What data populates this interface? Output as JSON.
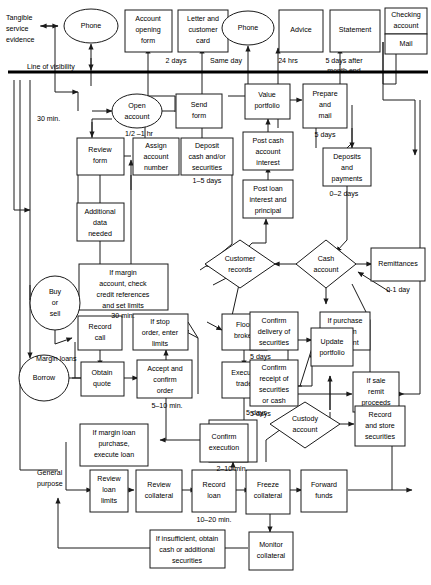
{
  "diagram": {
    "type": "service-blueprint-flowchart",
    "visibility_line_label": "Line of visibility",
    "evidence_label": "Tangible\nservice\nevidence",
    "evidence_lines": [
      "Tangible",
      "service",
      "evidence"
    ],
    "colors": {
      "stroke": "#1a1a1a",
      "fill": "#ffffff",
      "visibility_line": "#000000"
    }
  },
  "nodes": {
    "phone1": {
      "label": "Phone",
      "shape": "ellipse"
    },
    "account_opening_form": {
      "label": "Account\nopening\nform",
      "lines": [
        "Account",
        "opening",
        "form"
      ],
      "shape": "rect"
    },
    "letter_customer_card": {
      "label": "Letter and\ncustomer\ncard",
      "lines": [
        "Letter and",
        "customer",
        "card"
      ],
      "shape": "rect"
    },
    "phone2": {
      "label": "Phone",
      "shape": "ellipse"
    },
    "advice": {
      "label": "Advice",
      "shape": "rect"
    },
    "statement": {
      "label": "Statement",
      "shape": "rect"
    },
    "checking_account": {
      "label": "Checking\naccount",
      "lines": [
        "Checking",
        "account"
      ],
      "shape": "rect"
    },
    "mail": {
      "label": "Mail",
      "shape": "rect"
    },
    "open_account": {
      "label": "Open\naccount",
      "lines": [
        "Open",
        "account"
      ],
      "shape": "ellipse"
    },
    "send_form": {
      "label": "Send\nform",
      "lines": [
        "Send",
        "form"
      ],
      "shape": "rect"
    },
    "review_form": {
      "label": "Review\nform",
      "lines": [
        "Review",
        "form"
      ],
      "shape": "rect"
    },
    "assign_account_number": {
      "label": "Assign\naccount\nnumber",
      "lines": [
        "Assign",
        "account",
        "number"
      ],
      "shape": "rect"
    },
    "deposit_cash": {
      "label": "Deposit\ncash and/or\nsecurities",
      "lines": [
        "Deposit",
        "cash and/or",
        "securities"
      ],
      "shape": "rect"
    },
    "additional_data": {
      "label": "Additional\ndata\nneeded",
      "lines": [
        "Additional",
        "data",
        "needed"
      ],
      "shape": "rect"
    },
    "if_margin_check": {
      "label": "If margin\naccount, check\ncredit references\nand set limits",
      "lines": [
        "If margin",
        "account, check",
        "credit references",
        "and set limits"
      ],
      "shape": "rect"
    },
    "value_portfolio": {
      "label": "Value\nportfolio",
      "lines": [
        "Value",
        "portfolio"
      ],
      "shape": "rect"
    },
    "prepare_mail": {
      "label": "Prepare\nand\nmail",
      "lines": [
        "Prepare",
        "and",
        "mail"
      ],
      "shape": "rect"
    },
    "post_cash_interest": {
      "label": "Post cash\naccount\ninterest",
      "lines": [
        "Post cash",
        "account",
        "interest"
      ],
      "shape": "rect"
    },
    "deposits_payments": {
      "label": "Deposits\nand\npayments",
      "lines": [
        "Deposits",
        "and",
        "payments"
      ],
      "shape": "rect"
    },
    "post_loan_interest": {
      "label": "Post loan\ninterest and\nprincipal",
      "lines": [
        "Post loan",
        "interest and",
        "principal"
      ],
      "shape": "rect"
    },
    "customer_records": {
      "label": "Customer\nrecords",
      "lines": [
        "Customer",
        "records"
      ],
      "shape": "diamond"
    },
    "cash_account": {
      "label": "Cash\naccount",
      "lines": [
        "Cash",
        "account"
      ],
      "shape": "diamond"
    },
    "remittances": {
      "label": "Remittances",
      "shape": "rect"
    },
    "buy_or_sell": {
      "label": "Buy\nor\nsell",
      "lines": [
        "Buy",
        "or",
        "sell"
      ],
      "shape": "ellipse"
    },
    "borrow": {
      "label": "Borrow",
      "shape": "ellipse"
    },
    "record_call": {
      "label": "Record\ncall",
      "lines": [
        "Record",
        "call"
      ],
      "shape": "rect"
    },
    "if_stop_order": {
      "label": "If stop\norder, enter\nlimits",
      "lines": [
        "If stop",
        "order, enter",
        "limits"
      ],
      "shape": "rect"
    },
    "floor_broker": {
      "label": "Floor\nbroker",
      "lines": [
        "Floor",
        "broker"
      ],
      "shape": "rect"
    },
    "obtain_quote": {
      "label": "Obtain\nquote",
      "lines": [
        "Obtain",
        "quote"
      ],
      "shape": "rect"
    },
    "accept_confirm_order": {
      "label": "Accept and\nconfirm\norder",
      "lines": [
        "Accept and",
        "confirm",
        "order"
      ],
      "shape": "rect"
    },
    "execute_trade": {
      "label": "Execute\ntrade",
      "lines": [
        "Execute",
        "trade"
      ],
      "shape": "rect"
    },
    "confirm_delivery": {
      "label": "Confirm\ndelivery of\nsecurities",
      "lines": [
        "Confirm",
        "delivery of",
        "securities"
      ],
      "shape": "rect"
    },
    "confirm_receipt": {
      "label": "Confirm\nreceipt of\nsecurities\nor cash",
      "lines": [
        "Confirm",
        "receipt of",
        "securities",
        "or cash"
      ],
      "shape": "rect"
    },
    "update_portfolio": {
      "label": "Update\nportfolio",
      "lines": [
        "Update",
        "portfolio"
      ],
      "shape": "rect"
    },
    "if_purchase_confirm": {
      "label": "If purchase\nconfirm\npayment",
      "lines": [
        "If purchase",
        "confirm",
        "payment"
      ],
      "shape": "rect"
    },
    "if_sale_remit": {
      "label": "If sale\nremit\nproceeds",
      "lines": [
        "If sale",
        "remit",
        "proceeds"
      ],
      "shape": "rect"
    },
    "if_margin_loan": {
      "label": "If margin loan\npurchase,\nexecute loan",
      "lines": [
        "If margin loan",
        "purchase,",
        "execute loan"
      ],
      "shape": "rect"
    },
    "approve_margin": {
      "label": "Approve\nmargin\npurchase",
      "lines": [
        "Approve",
        "margin",
        "purchase"
      ],
      "shape": "rect"
    },
    "confirm_execution": {
      "label": "Confirm\nexecution",
      "lines": [
        "Confirm",
        "execution"
      ],
      "shape": "rect"
    },
    "custody_account": {
      "label": "Custody\naccount",
      "lines": [
        "Custody",
        "account"
      ],
      "shape": "diamond"
    },
    "record_store_securities": {
      "label": "Record\nand store\nsecurities",
      "lines": [
        "Record",
        "and store",
        "securities"
      ],
      "shape": "rect"
    },
    "review_loan_limits": {
      "label": "Review\nloan\nlimits",
      "lines": [
        "Review",
        "loan",
        "limits"
      ],
      "shape": "rect"
    },
    "review_collateral": {
      "label": "Review\ncollateral",
      "lines": [
        "Review",
        "collateral"
      ],
      "shape": "rect"
    },
    "record_loan": {
      "label": "Record\nloan",
      "lines": [
        "Record",
        "loan"
      ],
      "shape": "rect"
    },
    "freeze_collateral": {
      "label": "Freeze\ncollateral",
      "lines": [
        "Freeze",
        "collateral"
      ],
      "shape": "rect"
    },
    "forward_funds": {
      "label": "Forward\nfunds",
      "lines": [
        "Forward",
        "funds"
      ],
      "shape": "rect"
    },
    "if_insufficient": {
      "label": "If insufficient, obtain\ncash or additional\nsecurities",
      "lines": [
        "If insufficient, obtain",
        "cash or additional",
        "securities"
      ],
      "shape": "rect"
    },
    "monitor_collateral": {
      "label": "Monitor\ncollateral",
      "lines": [
        "Monitor",
        "collateral"
      ],
      "shape": "rect"
    }
  },
  "annotations": {
    "a_2days": "2 days",
    "a_sameday": "Same day",
    "a_24hrs": "24 hrs",
    "a_5days_month": "5 days after\nmonth end",
    "a_5days_month_l1": "5 days after",
    "a_5days_month_l2": "month end",
    "a_half_1hr": "1/2 –1 hr",
    "a_30min_left": "30 min.",
    "a_1_5days": "1–5 days",
    "a_5days_prepare": "5 days",
    "a_0_2days": "0–2 days",
    "a_0_1day": "0-1 day",
    "a_30min_margin": "30 min.",
    "a_margin_loans": "Margin loans",
    "a_5_10min": "5–10 min.",
    "a_5days_delivery": "5 days",
    "a_5days_receipt": "5 days",
    "a_5days_custody": "5 days",
    "a_2_10min": "2–10 min.",
    "a_10_20min": "10–20 min.",
    "a_general_purpose": "General\npurpose",
    "a_general_purpose_l1": "General",
    "a_general_purpose_l2": "purpose"
  }
}
